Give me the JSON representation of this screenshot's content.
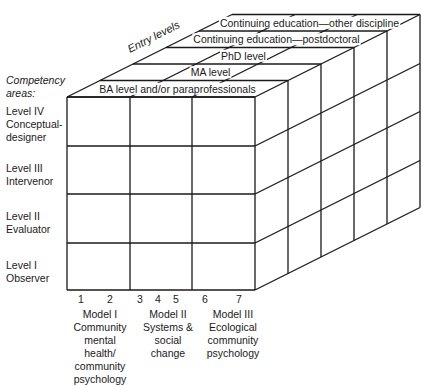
{
  "diagram": {
    "title_axis_entry": "Entry levels",
    "title_axis_competency": [
      "Competency",
      "areas:"
    ],
    "entry_levels": [
      "BA level and/or paraprofessionals",
      "MA level",
      "PhD level",
      "Continuing education—postdoctoral",
      "Continuing education—other discipline"
    ],
    "competency_areas": [
      {
        "level": "Level IV",
        "name": [
          "Conceptual-",
          "designer"
        ]
      },
      {
        "level": "Level III",
        "name": [
          "Intervenor"
        ]
      },
      {
        "level": "Level II",
        "name": [
          "Evaluator"
        ]
      },
      {
        "level": "Level I",
        "name": [
          "Observer"
        ]
      }
    ],
    "column_numbers": [
      "1",
      "2",
      "3",
      "4",
      "5",
      "6",
      "7"
    ],
    "models": [
      {
        "lines": [
          "Model I",
          "Community",
          "mental",
          "health/",
          "community",
          "psychology"
        ]
      },
      {
        "lines": [
          "Model II",
          "Systems &",
          "social",
          "change"
        ]
      },
      {
        "lines": [
          "Model III",
          "Ecological",
          "community",
          "psychology"
        ]
      }
    ],
    "colors": {
      "ink": "#1a1a1a",
      "background": "#ffffff"
    }
  }
}
